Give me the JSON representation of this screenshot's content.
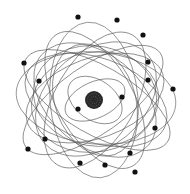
{
  "diagram": {
    "colors": {
      "background": "#ffffff",
      "orbit": "#555555",
      "electron": "#111111",
      "nucleus": "#2a2a2a"
    },
    "nucleus": {
      "cx": 94,
      "cy": 100,
      "r": 9
    },
    "orbits": [
      {
        "cx": 95,
        "cy": 100,
        "rx": 32,
        "ry": 18,
        "rot": -25
      },
      {
        "cx": 95,
        "cy": 100,
        "rx": 30,
        "ry": 20,
        "rot": 35
      },
      {
        "cx": 95,
        "cy": 98,
        "rx": 72,
        "ry": 40,
        "rot": -20
      },
      {
        "cx": 96,
        "cy": 100,
        "rx": 74,
        "ry": 42,
        "rot": 20
      },
      {
        "cx": 95,
        "cy": 100,
        "rx": 76,
        "ry": 38,
        "rot": 60
      },
      {
        "cx": 95,
        "cy": 100,
        "rx": 75,
        "ry": 40,
        "rot": -60
      },
      {
        "cx": 96,
        "cy": 98,
        "rx": 80,
        "ry": 46,
        "rot": 5
      },
      {
        "cx": 94,
        "cy": 100,
        "rx": 78,
        "ry": 44,
        "rot": 85
      },
      {
        "cx": 96,
        "cy": 99,
        "rx": 68,
        "ry": 48,
        "rot": -40
      },
      {
        "cx": 95,
        "cy": 100,
        "rx": 70,
        "ry": 46,
        "rot": 40
      },
      {
        "cx": 95,
        "cy": 96,
        "rx": 62,
        "ry": 50,
        "rot": 10
      },
      {
        "cx": 95,
        "cy": 102,
        "rx": 64,
        "ry": 50,
        "rot": -10
      },
      {
        "cx": 97,
        "cy": 100,
        "rx": 82,
        "ry": 34,
        "rot": 30
      },
      {
        "cx": 93,
        "cy": 100,
        "rx": 82,
        "ry": 34,
        "rot": -35
      },
      {
        "cx": 95,
        "cy": 100,
        "rx": 58,
        "ry": 40,
        "rot": 70
      }
    ],
    "electrons": [
      {
        "cx": 78,
        "cy": 17
      },
      {
        "cx": 117,
        "cy": 20
      },
      {
        "cx": 143,
        "cy": 35
      },
      {
        "cx": 24,
        "cy": 63
      },
      {
        "cx": 148,
        "cy": 62
      },
      {
        "cx": 39,
        "cy": 81
      },
      {
        "cx": 148,
        "cy": 80
      },
      {
        "cx": 173,
        "cy": 89
      },
      {
        "cx": 122,
        "cy": 97
      },
      {
        "cx": 78,
        "cy": 109
      },
      {
        "cx": 155,
        "cy": 128
      },
      {
        "cx": 45,
        "cy": 139
      },
      {
        "cx": 28,
        "cy": 149
      },
      {
        "cx": 130,
        "cy": 153
      },
      {
        "cx": 80,
        "cy": 163
      },
      {
        "cx": 105,
        "cy": 165
      },
      {
        "cx": 135,
        "cy": 172
      }
    ],
    "electron_radius": 2.6
  }
}
